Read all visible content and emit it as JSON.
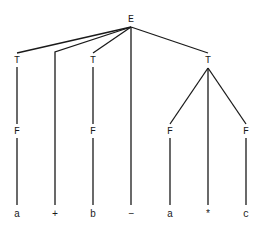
{
  "diagram": {
    "type": "parse-tree",
    "nodes": [
      {
        "id": "E",
        "label": "E",
        "x": 131,
        "y": 19
      },
      {
        "id": "T1",
        "label": "T",
        "x": 17,
        "y": 60
      },
      {
        "id": "T2",
        "label": "T",
        "x": 93,
        "y": 60
      },
      {
        "id": "T3",
        "label": "T",
        "x": 208,
        "y": 60
      },
      {
        "id": "F1",
        "label": "F",
        "x": 17,
        "y": 131
      },
      {
        "id": "F2",
        "label": "F",
        "x": 93,
        "y": 131
      },
      {
        "id": "F3",
        "label": "F",
        "x": 170,
        "y": 131
      },
      {
        "id": "F4",
        "label": "F",
        "x": 246,
        "y": 131
      },
      {
        "id": "a1",
        "label": "a",
        "x": 17,
        "y": 214
      },
      {
        "id": "plus",
        "label": "+",
        "x": 55,
        "y": 214
      },
      {
        "id": "b",
        "label": "b",
        "x": 93,
        "y": 214
      },
      {
        "id": "minus",
        "label": "−",
        "x": 131,
        "y": 214
      },
      {
        "id": "a2",
        "label": "a",
        "x": 170,
        "y": 214
      },
      {
        "id": "star",
        "label": "*",
        "x": 208,
        "y": 214
      },
      {
        "id": "c",
        "label": "c",
        "x": 246,
        "y": 214
      }
    ],
    "edges": [
      {
        "from": "E",
        "to": "T1",
        "x1": 131,
        "y1": 27,
        "x2": 17,
        "y2": 53
      },
      {
        "from": "E",
        "to": "plus",
        "x1": 131,
        "y1": 27,
        "x2": 55,
        "y2": 52,
        "bend_to_y": 205
      },
      {
        "from": "E",
        "to": "T2",
        "x1": 131,
        "y1": 27,
        "x2": 93,
        "y2": 53
      },
      {
        "from": "E",
        "to": "minus",
        "x1": 131,
        "y1": 27,
        "x2": 131,
        "y2": 205
      },
      {
        "from": "E",
        "to": "T3",
        "x1": 131,
        "y1": 27,
        "x2": 208,
        "y2": 53
      },
      {
        "from": "T1",
        "to": "F1",
        "x1": 17,
        "y1": 67,
        "x2": 17,
        "y2": 124
      },
      {
        "from": "T2",
        "to": "F2",
        "x1": 93,
        "y1": 67,
        "x2": 93,
        "y2": 124
      },
      {
        "from": "T3",
        "to": "F3",
        "x1": 208,
        "y1": 68,
        "x2": 170,
        "y2": 124
      },
      {
        "from": "T3",
        "to": "star",
        "x1": 208,
        "y1": 68,
        "x2": 208,
        "y2": 205
      },
      {
        "from": "T3",
        "to": "F4",
        "x1": 208,
        "y1": 68,
        "x2": 246,
        "y2": 124
      },
      {
        "from": "F1",
        "to": "a1",
        "x1": 17,
        "y1": 138,
        "x2": 17,
        "y2": 205
      },
      {
        "from": "F2",
        "to": "b",
        "x1": 93,
        "y1": 138,
        "x2": 93,
        "y2": 205
      },
      {
        "from": "F3",
        "to": "a2",
        "x1": 170,
        "y1": 138,
        "x2": 170,
        "y2": 205
      },
      {
        "from": "F4",
        "to": "c",
        "x1": 246,
        "y1": 138,
        "x2": 246,
        "y2": 205
      }
    ],
    "leaf_string": "a + b − a * c"
  }
}
